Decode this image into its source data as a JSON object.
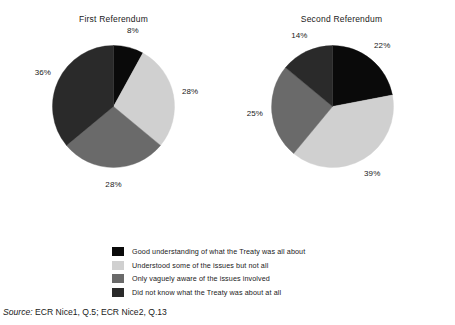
{
  "chart_data": {
    "type": "pie",
    "title": "",
    "charts": [
      {
        "title": "First Referendum",
        "labels": [
          "Good understanding of what the Treaty was all about",
          "Understood some of the issues but not all",
          "Only vaguely aware of the issues involved",
          "Did not know what the Treaty was about at all"
        ],
        "values": [
          8,
          28,
          28,
          36
        ],
        "value_labels": [
          "8%",
          "28%",
          "28%",
          "36%"
        ],
        "colors": [
          "#0a0a0a",
          "#d0d0d0",
          "#6a6a6a",
          "#2a2a2a"
        ]
      },
      {
        "title": "Second Referendum",
        "labels": [
          "Good understanding of what the Treaty was all about",
          "Understood some of the issues but not all",
          "Only vaguely aware of the issues involved",
          "Did not know what the Treaty was about at all"
        ],
        "values": [
          22,
          39,
          25,
          14
        ],
        "value_labels": [
          "22%",
          "39%",
          "25%",
          "14%"
        ],
        "colors": [
          "#0a0a0a",
          "#d0d0d0",
          "#6a6a6a",
          "#2a2a2a"
        ]
      }
    ],
    "legend": {
      "position": "bottom",
      "entries": [
        {
          "label": "Good understanding of what the Treaty was all about",
          "color": "#0a0a0a"
        },
        {
          "label": "Understood some of the issues but not all",
          "color": "#d0d0d0"
        },
        {
          "label": "Only vaguely aware of the issues involved",
          "color": "#6a6a6a"
        },
        {
          "label": "Did not know what the Treaty was about at all",
          "color": "#2a2a2a"
        }
      ]
    },
    "units": "percent",
    "start_angle_deg": 0,
    "direction": "clockwise"
  },
  "source": {
    "label": "Source:",
    "text": " ECR Nice1, Q.5; ECR Nice2, Q.13"
  }
}
